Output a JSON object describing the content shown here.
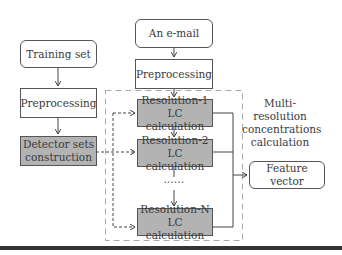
{
  "diagram": {
    "nodes": {
      "training_set": "Training set",
      "preprocessing_left": "Preprocessing",
      "detector_sets_line1": "Detector sets",
      "detector_sets_line2": "construction",
      "email": "An e-mail",
      "preprocessing_right": "Preprocessing",
      "res1_line1": "Resolution-1",
      "res1_line2": "LC calculation",
      "res2_line1": "Resolution-2",
      "res2_line2": "LC calculation",
      "ellipsis": "••••••",
      "resN_line1": "Resolution-N",
      "resN_line2": "LC calculation",
      "feature_line1": "Feature",
      "feature_line2": "vector"
    },
    "group_label": {
      "line1": "Multi-resolution",
      "line2": "concentrations",
      "line3": "calculation"
    },
    "colors": {
      "process_fill": "#b3b3b3",
      "border": "#555555"
    }
  }
}
